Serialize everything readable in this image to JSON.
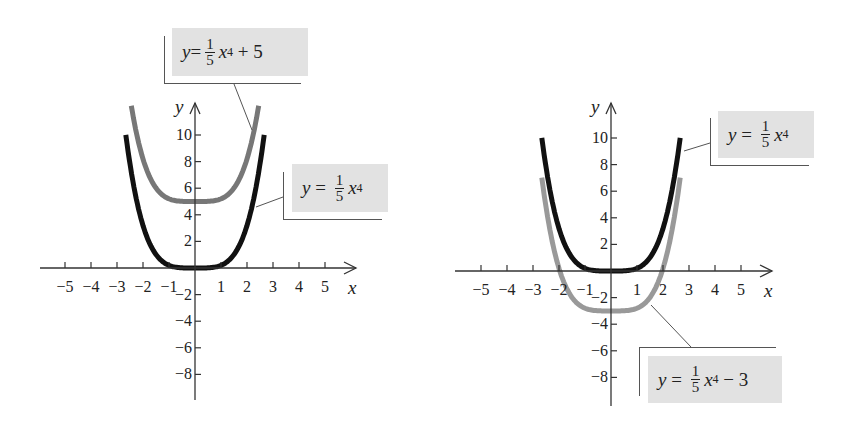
{
  "chart_data": [
    {
      "type": "line",
      "title": "",
      "xlabel": "x",
      "ylabel": "y",
      "xlim": [
        -5.5,
        5.5
      ],
      "ylim": [
        -10,
        12
      ],
      "grid": false,
      "x_ticks": [
        -5,
        -4,
        -3,
        -2,
        -1,
        1,
        2,
        3,
        4,
        5
      ],
      "x_tick_labels": [
        "−5",
        "−4",
        "−3",
        "−2",
        "−1",
        "1",
        "2",
        "3",
        "4",
        "5"
      ],
      "y_ticks": [
        10,
        8,
        6,
        4,
        2,
        -2,
        -4,
        -6,
        -8
      ],
      "y_tick_labels": [
        "10",
        "8",
        "6",
        "4",
        "2",
        "−2",
        "−4",
        "−6",
        "−8"
      ],
      "series": [
        {
          "name": "y = 1/5 x^4",
          "color": "#111111",
          "x": [
            -2.66,
            -2.5,
            -2,
            -1.5,
            -1,
            -0.5,
            0,
            0.5,
            1,
            1.5,
            2,
            2.5,
            2.66
          ],
          "values": [
            10.0,
            7.81,
            3.2,
            1.01,
            0.2,
            0.01,
            0,
            0.01,
            0.2,
            1.01,
            3.2,
            7.81,
            10.0
          ]
        },
        {
          "name": "y = 1/5 x^4 + 5",
          "color": "#777777",
          "x": [
            -2.45,
            -2,
            -1.5,
            -1,
            -0.5,
            0,
            0.5,
            1,
            1.5,
            2,
            2.45
          ],
          "values": [
            12.2,
            8.2,
            6.01,
            5.2,
            5.01,
            5,
            5.01,
            5.2,
            6.01,
            8.2,
            12.2
          ]
        }
      ],
      "annotations": [
        {
          "label_parts": [
            "y",
            " = ",
            "1",
            "5",
            "x",
            "4",
            " + 5"
          ],
          "points_to": "y = 1/5 x^4 + 5"
        },
        {
          "label_parts": [
            "y",
            " = ",
            "1",
            "5",
            "x",
            "4",
            ""
          ],
          "points_to": "y = 1/5 x^4"
        }
      ]
    },
    {
      "type": "line",
      "title": "",
      "xlabel": "x",
      "ylabel": "y",
      "xlim": [
        -5.5,
        5.5
      ],
      "ylim": [
        -10,
        12
      ],
      "grid": false,
      "x_ticks": [
        -5,
        -4,
        -3,
        -2,
        -1,
        1,
        2,
        3,
        4,
        5
      ],
      "x_tick_labels": [
        "−5",
        "−4",
        "−3",
        "−2",
        "−1",
        "1",
        "2",
        "3",
        "4",
        "5"
      ],
      "y_ticks": [
        10,
        8,
        6,
        4,
        2,
        -2,
        -4,
        -6,
        -8
      ],
      "y_tick_labels": [
        "10",
        "8",
        "6",
        "4",
        "2",
        "−2",
        "−4",
        "−6",
        "−8"
      ],
      "series": [
        {
          "name": "y = 1/5 x^4",
          "color": "#111111",
          "x": [
            -2.66,
            -2.5,
            -2,
            -1.5,
            -1,
            -0.5,
            0,
            0.5,
            1,
            1.5,
            2,
            2.5,
            2.66
          ],
          "values": [
            10.0,
            7.81,
            3.2,
            1.01,
            0.2,
            0.01,
            0,
            0.01,
            0.2,
            1.01,
            3.2,
            7.81,
            10.0
          ]
        },
        {
          "name": "y = 1/5 x^4 − 3",
          "color": "#999999",
          "x": [
            -2.66,
            -2.5,
            -2,
            -1.5,
            -1,
            -0.5,
            0,
            0.5,
            1,
            1.5,
            2,
            2.5,
            2.66
          ],
          "values": [
            7.0,
            4.81,
            0.2,
            -1.99,
            -2.8,
            -2.99,
            -3,
            -2.99,
            -2.8,
            -1.99,
            0.2,
            4.81,
            7.0
          ]
        }
      ],
      "annotations": [
        {
          "label_parts": [
            "y",
            " = ",
            "1",
            "5",
            "x",
            "4",
            ""
          ],
          "points_to": "y = 1/5 x^4"
        },
        {
          "label_parts": [
            "y",
            " = ",
            "1",
            "5",
            "x",
            "4",
            " − 3"
          ],
          "points_to": "y = 1/5 x^4 − 3"
        }
      ]
    }
  ],
  "labels": {
    "x_axis": "x",
    "y_axis": "y"
  }
}
